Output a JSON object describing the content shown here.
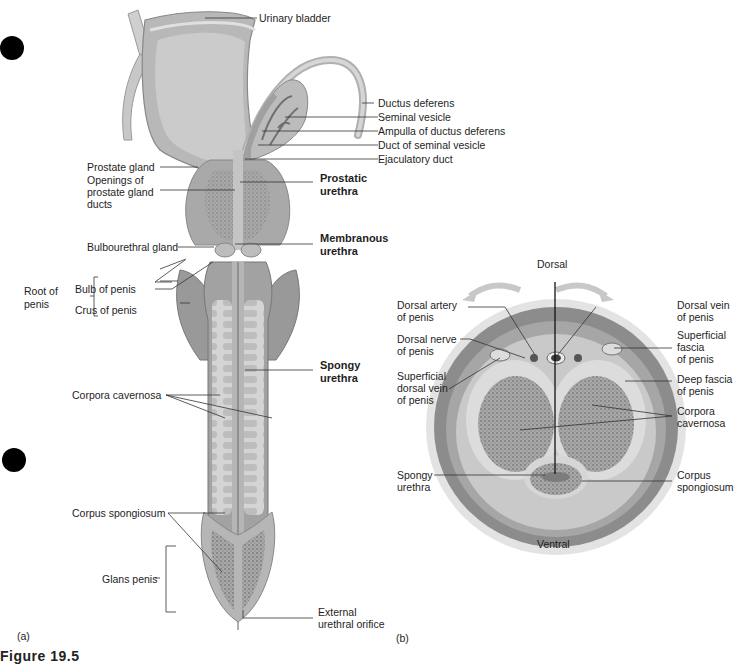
{
  "binder_holes": [
    "hole-top",
    "hole-bottom"
  ],
  "panel_a": {
    "tag": "(a)",
    "labels": {
      "urinary_bladder": "Urinary bladder",
      "ductus_deferens": "Ductus deferens",
      "seminal_vesicle": "Seminal vesicle",
      "ampulla": "Ampulla of ductus deferens",
      "duct_seminal_vesicle": "Duct of seminal vesicle",
      "ejaculatory_duct": "Ejaculatory duct",
      "prostate_gland": "Prostate gland",
      "openings_1": "Openings of",
      "openings_2": "prostate gland",
      "openings_3": "ducts",
      "prostatic_1": "Prostatic",
      "prostatic_2": "urethra",
      "membranous_1": "Membranous",
      "membranous_2": "urethra",
      "bulbourethral": "Bulbourethral gland",
      "root_1": "Root of",
      "root_2": "penis",
      "bulb": "Bulb of penis",
      "crus": "Crus of penis",
      "spongy_1": "Spongy",
      "spongy_2": "urethra",
      "corpora_cavernosa": "Corpora cavernosa",
      "corpus_spongiosum": "Corpus spongiosum",
      "glans": "Glans penis",
      "external_1": "External",
      "external_2": "urethral orifice"
    }
  },
  "panel_b": {
    "tag": "(b)",
    "labels": {
      "dorsal": "Dorsal",
      "ventral": "Ventral",
      "dorsal_artery_1": "Dorsal artery",
      "dorsal_artery_2": "of penis",
      "dorsal_nerve_1": "Dorsal nerve",
      "dorsal_nerve_2": "of penis",
      "sup_dorsal_vein_1": "Superficial",
      "sup_dorsal_vein_2": "dorsal vein",
      "sup_dorsal_vein_3": "of penis",
      "dorsal_vein_1": "Dorsal vein",
      "dorsal_vein_2": "of penis",
      "sup_fascia_1": "Superficial",
      "sup_fascia_2": "fascia",
      "sup_fascia_3": "of penis",
      "deep_fascia_1": "Deep fascia",
      "deep_fascia_2": "of penis",
      "corpora_cav_1": "Corpora",
      "corpora_cav_2": "cavernosa",
      "spongy_1": "Spongy",
      "spongy_2": "urethra",
      "corpus_spong_1": "Corpus",
      "corpus_spong_2": "spongiosum"
    }
  },
  "figure_caption": "Figure 19.5",
  "colors": {
    "tissue_dark": "#8f8f8f",
    "tissue_mid": "#b4b4b4",
    "tissue_light": "#d6d6d6",
    "erectile": "#9a9a9a",
    "line": "#333333"
  }
}
